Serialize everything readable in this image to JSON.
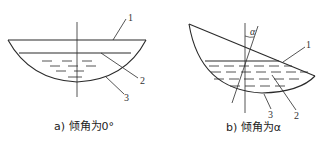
{
  "figure_a": {
    "caption": "a) 倾角为0°",
    "labels": {
      "rim": "1",
      "liquid_surface": "2",
      "bowl": "3"
    }
  },
  "figure_b": {
    "caption": "b) 倾角为α",
    "angle_symbol": "α",
    "labels": {
      "rim": "1",
      "liquid_surface": "2",
      "bowl": "3"
    }
  },
  "colors": {
    "stroke": "#2a2a2a",
    "background": "#ffffff"
  }
}
